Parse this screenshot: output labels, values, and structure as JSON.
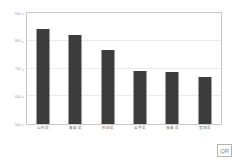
{
  "chart_data": {
    "type": "bar",
    "title": "",
    "subtitle": "",
    "xlabel": "",
    "ylabel": "",
    "categories": [
      "山形県",
      "青森県",
      "秋田県",
      "岩手県",
      "福島県",
      "宮城県"
    ],
    "values": [
      843,
      820,
      765,
      690,
      688,
      670
    ],
    "series": [
      {
        "name": "",
        "values": [
          843,
          820,
          765,
          690,
          688,
          670
        ]
      }
    ],
    "ylim": [
      500,
      900
    ],
    "yticks": [
      500,
      600,
      700,
      800,
      900
    ],
    "ytick_labels": [
      "500",
      "600",
      "700",
      "800",
      "900"
    ],
    "grid": true,
    "grid_axis": "y",
    "legend": false,
    "legend_position": "none",
    "bar_color": "#3c3c3c",
    "frame_color": "#c8c8c8",
    "grid_color": "#ececec",
    "background": "#ffffff"
  },
  "watermark": {
    "label": "QR"
  }
}
